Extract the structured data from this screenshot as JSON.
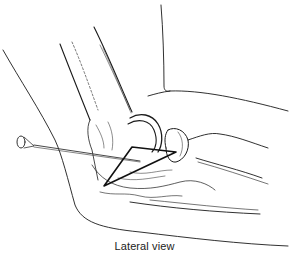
{
  "figure": {
    "caption": "Lateral view",
    "colors": {
      "line": "#1a1a1a",
      "background": "#ffffff",
      "needle": "#333333"
    }
  }
}
